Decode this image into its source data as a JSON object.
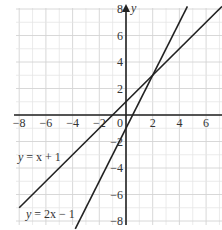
{
  "chart_data": {
    "type": "line",
    "title": "",
    "xlabel": "",
    "ylabel": "y",
    "xlim": [
      -8.2,
      7.2
    ],
    "ylim": [
      -8.2,
      8.2
    ],
    "grid": true,
    "grid_step": 1,
    "x_ticks": [
      -8,
      -6,
      -4,
      -2,
      0,
      2,
      4,
      6
    ],
    "y_ticks": [
      8,
      6,
      4,
      2,
      -2,
      -4,
      -6,
      -8
    ],
    "x_tick_labels": [
      "−8",
      "−6",
      "−4",
      "−2",
      "0",
      "2",
      "4",
      "6"
    ],
    "y_tick_labels": [
      "8",
      "6",
      "4",
      "2",
      "−2",
      "−4",
      "−6",
      "−8"
    ],
    "origin_label": "0",
    "y_axis_label": "y",
    "series": [
      {
        "name": "y = x + 1",
        "equation": "y = x + 1",
        "slope": 1,
        "intercept": 1,
        "x": [
          -8,
          7.2
        ],
        "y": [
          -7,
          8.2
        ]
      },
      {
        "name": "y = 2x − 1",
        "equation": "y = 2x − 1",
        "slope": 2,
        "intercept": -1,
        "x": [
          -3.8,
          4.6
        ],
        "y": [
          -8.6,
          8.2
        ]
      }
    ],
    "intersection": {
      "x": 2,
      "y": 3
    },
    "annotations": [
      {
        "text": "y = x + 1",
        "near": [
          -7.8,
          -2.5
        ]
      },
      {
        "text": "y = 2x − 1",
        "near": [
          -7,
          -7.5
        ]
      }
    ]
  },
  "labels": {
    "line1": {
      "y": "y",
      "eq": " = x + 1"
    },
    "line2": {
      "y": "y",
      "eq": " = 2x − 1"
    }
  }
}
